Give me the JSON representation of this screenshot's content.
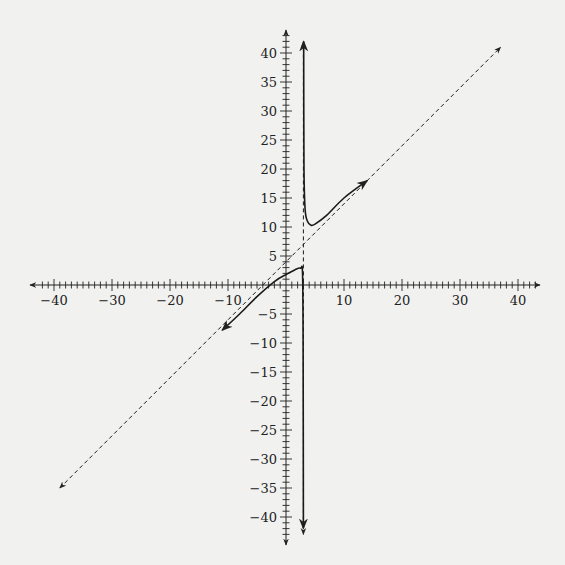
{
  "chart_data": {
    "type": "line",
    "title": "",
    "xlabel": "",
    "ylabel": "",
    "xlim": [
      -42,
      43
    ],
    "ylim": [
      -43,
      43
    ],
    "grid": false,
    "legend": null,
    "x_ticks": {
      "labels": [
        "-40",
        "-30",
        "-20",
        "-10",
        "10",
        "20",
        "30",
        "40"
      ],
      "values": [
        -40,
        -30,
        -20,
        -10,
        10,
        20,
        30,
        40
      ],
      "minor_step": 1
    },
    "y_ticks": {
      "labels": [
        "40",
        "35",
        "30",
        "25",
        "20",
        "15",
        "10",
        "5",
        "-5",
        "-10",
        "-15",
        "-20",
        "-25",
        "-30",
        "-35",
        "-40"
      ],
      "values": [
        40,
        35,
        30,
        25,
        20,
        15,
        10,
        5,
        -5,
        -10,
        -15,
        -20,
        -25,
        -30,
        -35,
        -40
      ],
      "minor_step": 1
    },
    "series": [
      {
        "name": "curve-right-branch",
        "style": "solid",
        "points": [
          [
            3.05,
            42
          ],
          [
            3.1,
            20
          ],
          [
            3.3,
            13
          ],
          [
            3.7,
            11
          ],
          [
            4.3,
            10.3
          ],
          [
            5,
            10.5
          ],
          [
            7,
            12
          ],
          [
            10,
            15
          ],
          [
            14,
            18
          ]
        ]
      },
      {
        "name": "curve-left-branch",
        "style": "solid",
        "points": [
          [
            -11,
            -7.8
          ],
          [
            -8,
            -5
          ],
          [
            -5,
            -2
          ],
          [
            -2,
            0.6
          ],
          [
            0,
            1.8
          ],
          [
            1.5,
            2.6
          ],
          [
            2.5,
            2.9
          ],
          [
            2.85,
            2
          ],
          [
            2.95,
            -10
          ],
          [
            3.0,
            -42
          ]
        ]
      },
      {
        "name": "oblique-asymptote",
        "style": "dashed",
        "equation": "y = x + 4",
        "points": [
          [
            -39,
            -35
          ],
          [
            37,
            41
          ]
        ]
      },
      {
        "name": "vertical-asymptote",
        "style": "dashed",
        "equation": "x = 3",
        "points": [
          [
            3,
            -43
          ],
          [
            3,
            42
          ]
        ]
      }
    ]
  }
}
